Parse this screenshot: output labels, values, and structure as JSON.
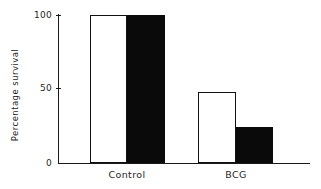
{
  "chart_data": {
    "type": "bar",
    "title": "",
    "xlabel": "",
    "ylabel": "Percentage survival",
    "categories": [
      "Control",
      "BCG"
    ],
    "ylim": [
      0,
      100
    ],
    "yticks": [
      0,
      50,
      100
    ],
    "ytick_labels": [
      "0",
      "50",
      "100"
    ],
    "grid": false,
    "legend": "none",
    "series": [
      {
        "name": "open",
        "style": "white-open-bar",
        "values": [
          100,
          48
        ]
      },
      {
        "name": "filled",
        "style": "black-filled-bar",
        "values": [
          100,
          24
        ]
      }
    ],
    "annotations": []
  },
  "axis": {
    "ylabel": "Percentage survival",
    "tick_100": "100",
    "tick_50": "50",
    "tick_0": "0"
  },
  "categories": {
    "control": "Control",
    "bcg": "BCG"
  },
  "colors": {
    "open_bar_fill": "#ffffff",
    "open_bar_stroke": "#111111",
    "filled_bar_fill": "#0a0a0a",
    "axis": "#1a1a1a",
    "text": "#1f1f1f",
    "background": "#ffffff"
  }
}
